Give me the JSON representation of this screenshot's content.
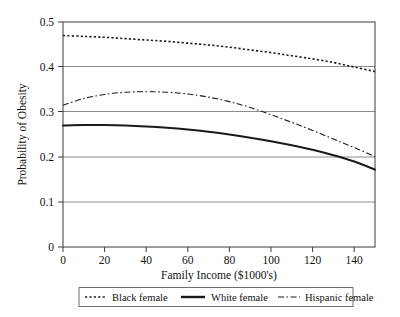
{
  "chart_data": {
    "type": "line",
    "title": "",
    "xlabel": "Family Income ($1000's)",
    "ylabel": "Probability of Obesity",
    "xlim": [
      0,
      150
    ],
    "ylim": [
      0,
      0.5
    ],
    "xticks": [
      "0",
      "20",
      "40",
      "60",
      "80",
      "100",
      "120",
      "140"
    ],
    "xtick_values": [
      0,
      20,
      40,
      60,
      80,
      100,
      120,
      140
    ],
    "yticks": [
      "0",
      "0.1",
      "0.2",
      "0.3",
      "0.4",
      "0.5"
    ],
    "ytick_values": [
      0,
      0.1,
      0.2,
      0.3,
      0.4,
      0.5
    ],
    "grid": "horizontal",
    "legend_position": "below-axes",
    "x": [
      0,
      10,
      20,
      30,
      40,
      50,
      60,
      70,
      80,
      90,
      100,
      110,
      120,
      130,
      140,
      150
    ],
    "series": [
      {
        "name": "Black female",
        "style": "dotted",
        "color": "#1a1a1a",
        "values": [
          0.47,
          0.468,
          0.466,
          0.463,
          0.46,
          0.457,
          0.453,
          0.449,
          0.444,
          0.438,
          0.432,
          0.425,
          0.418,
          0.41,
          0.4,
          0.39
        ]
      },
      {
        "name": "White female",
        "style": "solid",
        "color": "#1a1a1a",
        "values": [
          0.27,
          0.271,
          0.271,
          0.27,
          0.268,
          0.265,
          0.261,
          0.256,
          0.25,
          0.243,
          0.235,
          0.226,
          0.216,
          0.204,
          0.19,
          0.172
        ]
      },
      {
        "name": "Hispanic female",
        "style": "dash-dot",
        "color": "#1a1a1a",
        "values": [
          0.315,
          0.33,
          0.339,
          0.344,
          0.345,
          0.344,
          0.34,
          0.333,
          0.323,
          0.31,
          0.294,
          0.277,
          0.259,
          0.24,
          0.221,
          0.201
        ]
      }
    ]
  },
  "legend": {
    "items": [
      {
        "label": "Black female",
        "style": "dotted"
      },
      {
        "label": "White female",
        "style": "solid"
      },
      {
        "label": "Hispanic female",
        "style": "dash-dot"
      }
    ]
  }
}
